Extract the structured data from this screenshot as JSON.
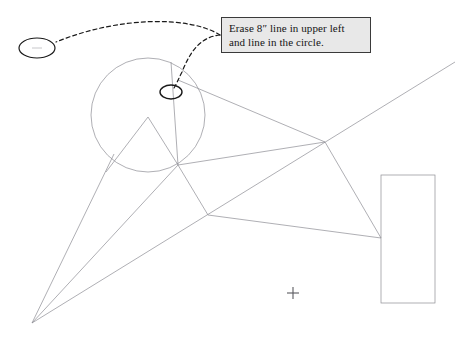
{
  "document": {
    "title": "Redline markup sketch",
    "background_color": "#ffffff",
    "width": 474,
    "height": 341
  },
  "callout": {
    "name": "erase-instruction-callout",
    "line1": "Erase 8″ line in upper left",
    "line2": "and line in the circle.",
    "fill_color": "#e8e8e8",
    "border_color": "#3a3a3a",
    "text_color": "#141414"
  },
  "annotations": {
    "leader_style": "dashed",
    "leader_color": "#1a1a1a",
    "targets": [
      {
        "name": "left-ellipse-target",
        "shape": "ellipse",
        "cx": 37,
        "cy": 48,
        "rx": 18,
        "ry": 10,
        "description": "Circled 8 inch line in upper left"
      },
      {
        "name": "circle-ellipse-target",
        "shape": "ellipse",
        "cx": 171,
        "cy": 92,
        "rx": 11,
        "ry": 7,
        "description": "Circled line inside the circle"
      }
    ]
  },
  "geometry": {
    "line_color": "#8d8d93",
    "marker_color": "#5a5a60",
    "circle": {
      "name": "main-circle",
      "cx": 148,
      "cy": 115,
      "r": 57
    },
    "rectangle": {
      "name": "right-rectangle",
      "x": 381,
      "y": 175,
      "width": 54,
      "height": 128
    },
    "cross_marker": {
      "name": "center-cross-marker",
      "cx": 293,
      "cy": 293,
      "size": 11
    },
    "vertices": {
      "circle_bottom_hub": [
        178,
        165
      ],
      "mid_hub": [
        208,
        215
      ],
      "upper_right_hub": [
        325,
        142
      ],
      "rect_left_hub": [
        381,
        238
      ],
      "bottom_left_apex": [
        32,
        323
      ],
      "triangle_apex": [
        148,
        117
      ],
      "diagonal_top_right": [
        455,
        62
      ]
    }
  }
}
